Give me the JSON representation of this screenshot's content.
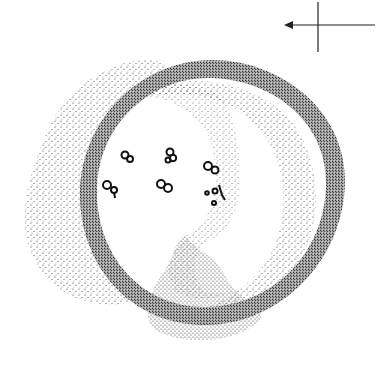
{
  "figure": {
    "type": "stipple-illustration",
    "colors": {
      "background": "#ffffff",
      "ink": "#111111"
    },
    "orientation_marker": {
      "description": "crosshair with arrow pointing left",
      "center": [
        318,
        24
      ],
      "arrow_direction": "left"
    },
    "granules_count": 7
  }
}
